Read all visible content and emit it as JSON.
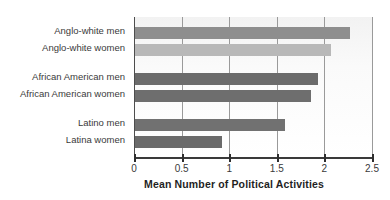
{
  "chart_data": {
    "type": "bar",
    "orientation": "horizontal",
    "title": "",
    "xlabel": "Mean Number of Political Activities",
    "ylabel": "",
    "xlim": [
      0,
      2.5
    ],
    "xticks": [
      "0",
      "0.5",
      "1",
      "1.5",
      "2",
      "2.5"
    ],
    "xtick_values": [
      0,
      0.5,
      1,
      1.5,
      2,
      2.5
    ],
    "grid": true,
    "legend": "none",
    "categories": [
      "Anglo-white men",
      "Anglo-white women",
      "African American men",
      "African American women",
      "Latino men",
      "Latina women"
    ],
    "values": [
      2.27,
      2.07,
      1.93,
      1.86,
      1.59,
      0.92
    ],
    "bar_colors": [
      "#8e8e8e",
      "#b8b8b8",
      "#6b6b6b",
      "#6e6e6e",
      "#717171",
      "#6b6b6b"
    ],
    "groups": [
      {
        "name": "Anglo-white",
        "categories": [
          "Anglo-white men",
          "Anglo-white women"
        ]
      },
      {
        "name": "African American",
        "categories": [
          "African American men",
          "African American women"
        ]
      },
      {
        "name": "Latino",
        "categories": [
          "Latino men",
          "Latina women"
        ]
      }
    ]
  },
  "colors": {
    "axis": "#3a3a3a",
    "gridline": "#9a9a9a",
    "label_text": "#3a3a3a",
    "title_text": "#1f1f1f",
    "background": "#ffffff"
  }
}
